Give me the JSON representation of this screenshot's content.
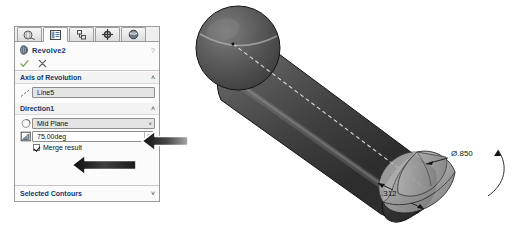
{
  "app": {
    "name": "SolidWorks PropertyManager"
  },
  "property_manager": {
    "tabs": [
      {
        "name": "feature-manager-tab",
        "icon": "tree-feature-icon",
        "active": false
      },
      {
        "name": "property-manager-tab",
        "icon": "property-list-icon",
        "active": true
      },
      {
        "name": "configuration-manager-tab",
        "icon": "configuration-icon",
        "active": false
      },
      {
        "name": "dimxpert-manager-tab",
        "icon": "dimxpert-target-icon",
        "active": false
      },
      {
        "name": "display-manager-tab",
        "icon": "display-sphere-icon",
        "active": false
      }
    ],
    "feature": {
      "icon": "revolve-feature-icon",
      "title": "Revolve2",
      "help_icon": "?"
    },
    "actions": {
      "ok_icon": "check-icon",
      "cancel_icon": "x-icon"
    },
    "groups": [
      {
        "name": "axis-of-revolution",
        "title": "Axis of Revolution",
        "expanded": true,
        "chevron": "˄",
        "icon": "axis-line-icon",
        "selection_value": "Line5"
      },
      {
        "name": "direction1",
        "title": "Direction1",
        "expanded": true,
        "chevron": "˄",
        "end_condition_icon": "revolve-direction-icon",
        "end_condition_value": "Mid Plane",
        "end_condition_arrow": "˅",
        "angle_icon": "angle-dim-icon",
        "angle_value": "75.00deg",
        "merge_result_label": "Merge result",
        "merge_result_checked": true
      },
      {
        "name": "selected-contours",
        "title": "Selected Contours",
        "expanded": false,
        "chevron": "˅"
      }
    ]
  },
  "callouts": [
    {
      "name": "callout-arrow-mid-plane",
      "points_to": "Mid Plane dropdown"
    },
    {
      "name": "callout-arrow-angle",
      "points_to": "75.00deg angle field"
    }
  ],
  "viewport": {
    "model": {
      "name": "revolved-ball-pin-model",
      "parts": [
        "sphere-head",
        "cylindrical-shaft",
        "revolve-preview-wedge"
      ],
      "centerline": "dashed-axis-of-revolution"
    },
    "dimensions": [
      {
        "name": "diameter-dimension",
        "label": "Ø.850"
      },
      {
        "name": "length-dimension",
        "label": ".312"
      }
    ]
  },
  "colors": {
    "panel_bg": "#fbfbfb",
    "panel_border": "#9a9a9a",
    "group_title": "#15366b",
    "model_body": "#4a4a4a",
    "model_highlight": "#8e8e8e",
    "preview_wedge": "#a9a9a9",
    "ok_check": "#6f9e4a"
  }
}
